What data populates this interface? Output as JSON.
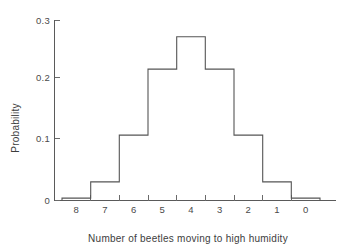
{
  "chart_data": {
    "type": "bar",
    "title": "",
    "subtitle": "",
    "xlabel": "Number of beetles moving to high humidity",
    "ylabel": "Probability",
    "categories": [
      "8",
      "7",
      "6",
      "5",
      "4",
      "3",
      "2",
      "1",
      "0"
    ],
    "values": [
      0.004,
      0.031,
      0.109,
      0.219,
      0.273,
      0.219,
      0.109,
      0.031,
      0.004
    ],
    "series": [
      {
        "name": "Probability",
        "values": [
          0.004,
          0.031,
          0.109,
          0.219,
          0.273,
          0.219,
          0.109,
          0.031,
          0.004
        ]
      }
    ],
    "xlim": [
      0,
      9
    ],
    "ylim": [
      0,
      0.3
    ],
    "y_ticks": [
      0,
      0.1,
      0.2,
      0.3
    ],
    "y_tick_labels": [
      "0",
      "0.1",
      "0.2",
      "0.3"
    ],
    "x_tick_labels": [
      "8",
      "7",
      "6",
      "5",
      "4",
      "3",
      "2",
      "1",
      "0"
    ],
    "grid": false,
    "legend": false,
    "legend_position": "none",
    "bar_style": "histogram-outline",
    "line_color": "#555555",
    "fill_color": "none",
    "background_color": "#ffffff",
    "text_color": "#3d3d3d",
    "annotations": []
  },
  "figure": {
    "background_color": "#ffffff",
    "axis_color": "#5a5a5a"
  }
}
